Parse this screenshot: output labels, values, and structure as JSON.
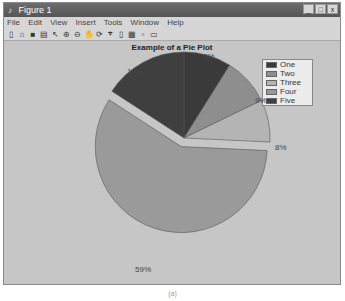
{
  "window": {
    "title": "Figure 1",
    "controls": [
      "_",
      "□",
      "x"
    ],
    "menu": [
      "File",
      "Edit",
      "View",
      "Insert",
      "Tools",
      "Window",
      "Help"
    ],
    "toolbar_icons": [
      "new-icon",
      "open-icon",
      "save-icon",
      "print-icon",
      "pointer-icon",
      "zoom-in-icon",
      "zoom-out-icon",
      "pan-icon",
      "rotate-icon",
      "datacursor-icon",
      "colorbar-icon",
      "legend-icon",
      "hide-plot-icon",
      "show-plot-icon"
    ]
  },
  "chart_data": {
    "type": "pie",
    "title": "Example of a Pie Plot",
    "categories": [
      "One",
      "Two",
      "Three",
      "Four",
      "Five"
    ],
    "values": [
      9,
      9,
      8,
      59,
      16
    ],
    "labels": [
      "9%",
      "9%",
      "8%",
      "59%",
      "16%"
    ],
    "exploded": [
      false,
      false,
      false,
      true,
      false
    ],
    "colors": [
      "#3a3a3a",
      "#8e8e8e",
      "#b4b4b4",
      "#9a9a9a",
      "#3f3f3f"
    ],
    "legend_position": "northeast"
  },
  "caption": "(a)"
}
